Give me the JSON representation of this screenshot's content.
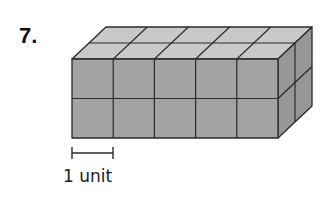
{
  "problem": {
    "number": "7."
  },
  "prism": {
    "length_cubes": 5,
    "height_cubes": 2,
    "depth_cubes": 2,
    "front_origin": [
      72,
      59
    ],
    "cube_size": [
      41.2,
      39.5
    ],
    "depth_offset": [
      17,
      -16
    ],
    "colors": {
      "top": "#c9c9c9",
      "front": "#a3a3a3",
      "side": "#979797",
      "edge": "#2a2a2a"
    }
  },
  "scale_bar": {
    "label": "1 unit",
    "x1": 72,
    "x2": 113,
    "y": 153
  }
}
